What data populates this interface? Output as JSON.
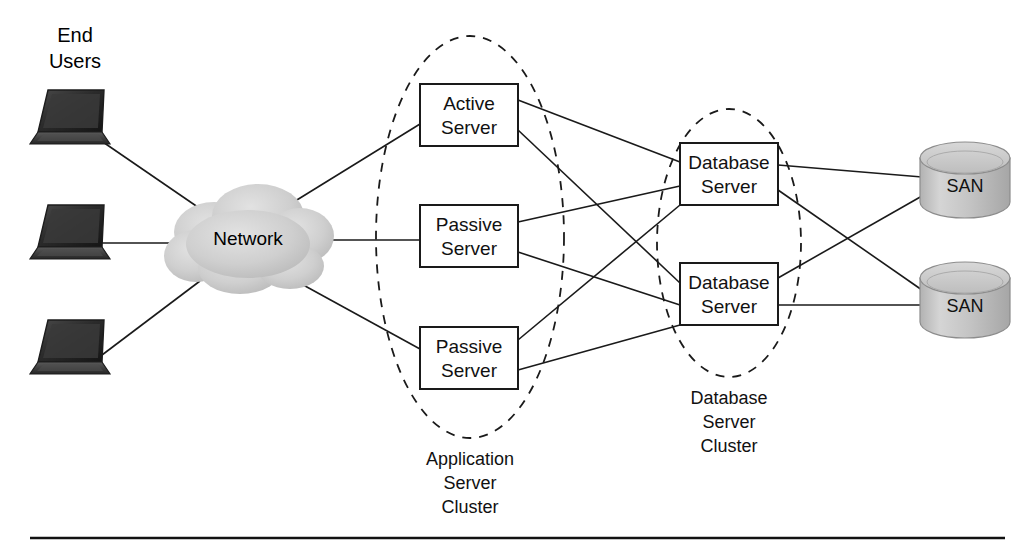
{
  "diagram": {
    "background_color": "#ffffff",
    "line_color": "#1a1a1a",
    "text_color": "#111111",
    "width": 1032,
    "height": 550
  },
  "end_users": {
    "label_line1": "End",
    "label_line2": "Users",
    "device_count": 3,
    "device_icon": "laptop-icon",
    "devices": [
      {
        "name": "laptop-top",
        "x": 30,
        "y": 88
      },
      {
        "name": "laptop-middle",
        "x": 22,
        "y": 203
      },
      {
        "name": "laptop-bottom",
        "x": 22,
        "y": 318
      }
    ]
  },
  "network": {
    "label": "Network",
    "icon": "cloud-icon",
    "fill_color": "#d2d2d2",
    "center_x": 248,
    "center_y": 240
  },
  "application_cluster": {
    "label_line1": "Application",
    "label_line2": "Server",
    "label_line3": "Cluster",
    "boundary": "dashed-ellipse",
    "servers": [
      {
        "line1": "Active",
        "line2": "Server",
        "role": "active",
        "cx": 469,
        "cy": 115
      },
      {
        "line1": "Passive",
        "line2": "Server",
        "role": "passive",
        "cx": 469,
        "cy": 236
      },
      {
        "line1": "Passive",
        "line2": "Server",
        "role": "passive",
        "cx": 469,
        "cy": 358
      }
    ]
  },
  "database_cluster": {
    "label_line1": "Database",
    "label_line2": "Server",
    "label_line3": "Cluster",
    "boundary": "dashed-ellipse",
    "servers": [
      {
        "line1": "Database",
        "line2": "Server",
        "cx": 729,
        "cy": 174
      },
      {
        "line1": "Database",
        "line2": "Server",
        "cx": 729,
        "cy": 294
      }
    ]
  },
  "storage": {
    "icon": "cylinder-icon",
    "fill_color": "#bdbdbd",
    "units": [
      {
        "label": "SAN",
        "cx": 965,
        "cy": 180
      },
      {
        "label": "SAN",
        "cx": 965,
        "cy": 300
      }
    ]
  },
  "footer": {
    "rule": "horizontal-divider"
  }
}
